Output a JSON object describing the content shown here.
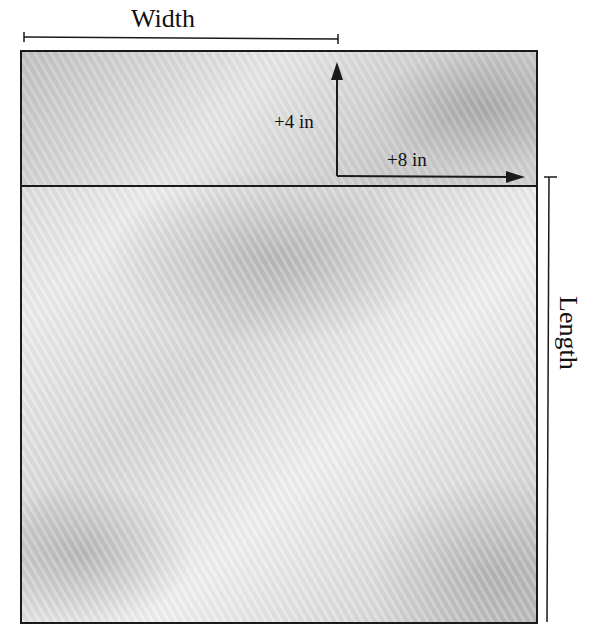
{
  "diagram": {
    "labels": {
      "width": "Width",
      "length": "Length",
      "height_increase": "+4 in",
      "width_increase": "+8 in"
    },
    "colors": {
      "line": "#1a1a1a",
      "fill_light": "#ececec",
      "fill_dark": "#c9c9c9"
    }
  }
}
